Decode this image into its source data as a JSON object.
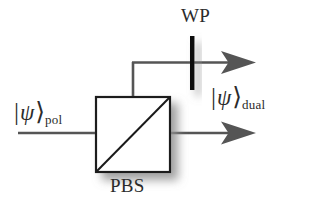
{
  "figure": {
    "background_color": "#ffffff",
    "line_color": "#555555",
    "outline_color": "#1a1a1a",
    "shadow_color": "#9a9a9a",
    "text_color": "#2b2b2b"
  },
  "labels": {
    "input_ket_bar": "|",
    "input_ket_symbol": "ψ",
    "input_ket_angle": "⟩",
    "input_ket_subscript": "pol",
    "output_ket_bar": "|",
    "output_ket_symbol": "ψ",
    "output_ket_angle": "⟩",
    "output_ket_subscript": "dual",
    "waveplate": "WP",
    "beamsplitter": "PBS"
  },
  "components": {
    "pbs": {
      "name": "PBS",
      "shape": "square",
      "x": 96,
      "y": 97,
      "width": 74,
      "height": 75,
      "diagonal": "bottom-left-to-top-right",
      "fill": "#ffffff",
      "stroke": "#1a1a1a"
    },
    "waveplate": {
      "name": "WP",
      "shape": "vertical-bar",
      "x": 192,
      "y_top": 36,
      "y_bottom": 90,
      "thickness": 4,
      "fill": "#111111"
    }
  },
  "beams": {
    "input": {
      "from_x": 18,
      "to_x": 96,
      "y": 133,
      "direction": "right"
    },
    "transmitted": {
      "from_x": 170,
      "to_x": 252,
      "y": 133,
      "direction": "right",
      "arrow": true
    },
    "reflected_vertical": {
      "x": 133,
      "from_y": 133,
      "to_y": 62
    },
    "reflected_horizontal": {
      "from_x": 133,
      "to_x": 252,
      "y": 62,
      "direction": "right",
      "arrow": true
    }
  }
}
